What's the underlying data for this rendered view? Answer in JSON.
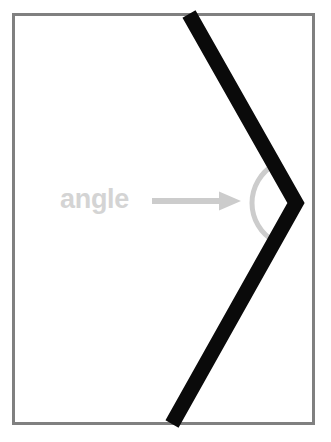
{
  "figure": {
    "background_color": "#ffffff",
    "frame": {
      "name": "image-border-frame",
      "color": "#808080",
      "stroke_width": 3,
      "x": 12,
      "y": 13,
      "width": 303,
      "height": 412
    }
  },
  "annotation": {
    "label": "angle",
    "label_color": "#d4d4d4",
    "label_x": 60,
    "label_y": 208,
    "arrow": {
      "name": "pointer-arrow",
      "color": "#cccccc",
      "start_x": 152,
      "end_x": 241,
      "y": 201,
      "shaft_thickness": 6,
      "head_width": 22,
      "head_height": 19
    }
  },
  "shape": {
    "name": "angle-chevron",
    "color": "#0a0a0a",
    "stroke_width": 15,
    "points": [
      {
        "x": 189,
        "y": 14
      },
      {
        "x": 296,
        "y": 203
      },
      {
        "x": 172,
        "y": 424
      }
    ],
    "vertex": {
      "x": 296,
      "y": 203
    },
    "arc": {
      "name": "angle-arc-marker",
      "color": "#cccccc",
      "stroke_width": 5,
      "center_x": 296,
      "center_y": 203,
      "radius": 44,
      "start_angle_deg": 119,
      "end_angle_deg": 241
    }
  },
  "chart_data": {
    "type": "diagram",
    "title": "angle",
    "annotations": [
      {
        "text": "angle",
        "points_to": "vertex"
      }
    ],
    "vertex": {
      "x": 296,
      "y": 203
    },
    "rays": [
      {
        "from": {
          "x": 296,
          "y": 203
        },
        "to": {
          "x": 189,
          "y": 14
        }
      },
      {
        "from": {
          "x": 296,
          "y": 203
        },
        "to": {
          "x": 172,
          "y": 424
        }
      }
    ]
  }
}
